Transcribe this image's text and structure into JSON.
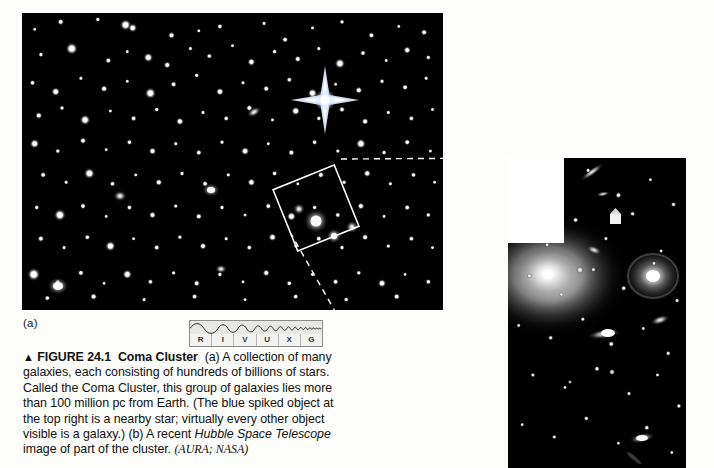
{
  "figure": {
    "panel_a_label": "(a)",
    "caption": {
      "triangle": "▲",
      "figure_number": "FIGURE 24.1",
      "figure_title": "Coma Cluster",
      "body_part_a": "(a) A collection of many galaxies, each consisting of hundreds of billions of stars. Called the Coma Cluster, this group of galaxies lies more than 100 million pc from Earth. (The blue spiked object at the top right is a nearby star; virtually every other object visible is a galaxy.)",
      "body_part_b_before": "(b) A recent ",
      "body_part_b_italic": "Hubble Space Telescope",
      "body_part_b_after": " image of part of the cluster. ",
      "credit": "(AURA; NASA)"
    }
  },
  "spectrum_band": {
    "name": "RIVUXG wavelength band indicator",
    "labels": [
      "R",
      "I",
      "V",
      "U",
      "X",
      "G"
    ],
    "active": "V",
    "box_color": "#e7e7e4",
    "border_color": "#8c8c8c"
  },
  "panel_a": {
    "name": "coma-cluster-wide-field",
    "background": "#000000",
    "callout_box": {
      "rotation_deg": -22,
      "center_x": 316,
      "center_y": 208,
      "size": 66,
      "stroke": "#ffffff"
    },
    "spiked_star": {
      "center_x": 325,
      "center_y": 100,
      "color": "#dfe8ff",
      "note": "blue spiked nearby star at top right"
    }
  },
  "panel_b": {
    "name": "hubble-close-up",
    "background": "#000000",
    "notch_color": "#ffffff"
  },
  "leader_lines": {
    "stroke": "#ffffff",
    "dash": "6 5"
  },
  "chart_data": {
    "type": "scatter",
    "xlabel": "",
    "ylabel": "",
    "note": "Point sources plotted as normalized coordinates 0-1 within panel a; r = relative brightness radius in px",
    "series": [
      {
        "name": "panel_a_sources",
        "points": [
          [
            0.03,
            0.055,
            1.0
          ],
          [
            0.092,
            0.03,
            1.5
          ],
          [
            0.18,
            0.022,
            1.2
          ],
          [
            0.246,
            0.04,
            2.6
          ],
          [
            0.263,
            0.05,
            2.0
          ],
          [
            0.355,
            0.075,
            1.6
          ],
          [
            0.42,
            0.06,
            1.0
          ],
          [
            0.47,
            0.045,
            1.3
          ],
          [
            0.575,
            0.035,
            1.1
          ],
          [
            0.625,
            0.09,
            1.4
          ],
          [
            0.69,
            0.05,
            1.0
          ],
          [
            0.76,
            0.03,
            1.2
          ],
          [
            0.83,
            0.075,
            1.4
          ],
          [
            0.895,
            0.045,
            1.0
          ],
          [
            0.955,
            0.065,
            1.5
          ],
          [
            0.045,
            0.14,
            1.2
          ],
          [
            0.118,
            0.12,
            2.8
          ],
          [
            0.205,
            0.16,
            1.4
          ],
          [
            0.25,
            0.13,
            1.0
          ],
          [
            0.3,
            0.15,
            2.2
          ],
          [
            0.345,
            0.175,
            1.6
          ],
          [
            0.4,
            0.12,
            1.1
          ],
          [
            0.445,
            0.145,
            1.3
          ],
          [
            0.5,
            0.11,
            1.0
          ],
          [
            0.545,
            0.165,
            1.8
          ],
          [
            0.6,
            0.13,
            1.2
          ],
          [
            0.655,
            0.155,
            1.5
          ],
          [
            0.705,
            0.12,
            1.1
          ],
          [
            0.755,
            0.17,
            2.4
          ],
          [
            0.81,
            0.135,
            1.3
          ],
          [
            0.865,
            0.16,
            1.0
          ],
          [
            0.915,
            0.125,
            1.7
          ],
          [
            0.965,
            0.15,
            1.2
          ],
          [
            0.025,
            0.235,
            1.3
          ],
          [
            0.08,
            0.265,
            2.0
          ],
          [
            0.14,
            0.22,
            1.1
          ],
          [
            0.195,
            0.255,
            1.6
          ],
          [
            0.25,
            0.23,
            1.0
          ],
          [
            0.305,
            0.27,
            2.6
          ],
          [
            0.36,
            0.24,
            1.4
          ],
          [
            0.415,
            0.21,
            1.2
          ],
          [
            0.47,
            0.265,
            1.8
          ],
          [
            0.525,
            0.235,
            1.1
          ],
          [
            0.58,
            0.255,
            1.5
          ],
          [
            0.635,
            0.225,
            1.3
          ],
          [
            0.69,
            0.27,
            2.2
          ],
          [
            0.745,
            0.24,
            1.0
          ],
          [
            0.8,
            0.26,
            1.6
          ],
          [
            0.855,
            0.23,
            1.2
          ],
          [
            0.91,
            0.25,
            1.4
          ],
          [
            0.96,
            0.22,
            1.1
          ],
          [
            0.04,
            0.345,
            1.6
          ],
          [
            0.095,
            0.32,
            1.2
          ],
          [
            0.15,
            0.36,
            2.4
          ],
          [
            0.21,
            0.33,
            1.0
          ],
          [
            0.265,
            0.355,
            1.4
          ],
          [
            0.32,
            0.325,
            1.2
          ],
          [
            0.375,
            0.365,
            1.8
          ],
          [
            0.43,
            0.335,
            1.1
          ],
          [
            0.485,
            0.355,
            1.3
          ],
          [
            0.54,
            0.32,
            1.5
          ],
          [
            0.595,
            0.36,
            1.0
          ],
          [
            0.65,
            0.33,
            2.0
          ],
          [
            0.705,
            0.355,
            1.2
          ],
          [
            0.76,
            0.325,
            1.4
          ],
          [
            0.815,
            0.365,
            1.6
          ],
          [
            0.87,
            0.335,
            1.1
          ],
          [
            0.925,
            0.355,
            1.3
          ],
          [
            0.975,
            0.325,
            1.0
          ],
          [
            0.03,
            0.44,
            2.2
          ],
          [
            0.085,
            0.465,
            1.2
          ],
          [
            0.145,
            0.43,
            1.5
          ],
          [
            0.2,
            0.46,
            1.0
          ],
          [
            0.255,
            0.435,
            1.3
          ],
          [
            0.31,
            0.465,
            1.7
          ],
          [
            0.365,
            0.44,
            1.1
          ],
          [
            0.42,
            0.47,
            1.4
          ],
          [
            0.475,
            0.435,
            1.2
          ],
          [
            0.53,
            0.465,
            1.9
          ],
          [
            0.585,
            0.44,
            1.0
          ],
          [
            0.64,
            0.47,
            1.5
          ],
          [
            0.695,
            0.435,
            1.3
          ],
          [
            0.75,
            0.465,
            1.1
          ],
          [
            0.805,
            0.44,
            2.3
          ],
          [
            0.86,
            0.47,
            1.2
          ],
          [
            0.915,
            0.435,
            1.4
          ],
          [
            0.97,
            0.465,
            1.0
          ],
          [
            0.05,
            0.545,
            1.4
          ],
          [
            0.105,
            0.57,
            1.1
          ],
          [
            0.16,
            0.54,
            2.5
          ],
          [
            0.215,
            0.575,
            1.3
          ],
          [
            0.27,
            0.545,
            1.0
          ],
          [
            0.325,
            0.57,
            1.6
          ],
          [
            0.38,
            0.54,
            1.2
          ],
          [
            0.435,
            0.575,
            1.4
          ],
          [
            0.49,
            0.545,
            1.1
          ],
          [
            0.545,
            0.57,
            1.8
          ],
          [
            0.6,
            0.54,
            1.3
          ],
          [
            0.655,
            0.575,
            1.0
          ],
          [
            0.71,
            0.545,
            1.5
          ],
          [
            0.765,
            0.57,
            1.2
          ],
          [
            0.82,
            0.54,
            1.7
          ],
          [
            0.875,
            0.575,
            1.1
          ],
          [
            0.93,
            0.545,
            1.3
          ],
          [
            0.98,
            0.57,
            1.0
          ],
          [
            0.035,
            0.655,
            1.2
          ],
          [
            0.09,
            0.68,
            2.7
          ],
          [
            0.145,
            0.65,
            1.4
          ],
          [
            0.2,
            0.685,
            1.0
          ],
          [
            0.255,
            0.655,
            1.3
          ],
          [
            0.31,
            0.68,
            1.6
          ],
          [
            0.365,
            0.65,
            1.1
          ],
          [
            0.42,
            0.685,
            1.5
          ],
          [
            0.475,
            0.655,
            1.2
          ],
          [
            0.53,
            0.68,
            1.0
          ],
          [
            0.585,
            0.65,
            1.4
          ],
          [
            0.64,
            0.685,
            2.1
          ],
          [
            0.695,
            0.655,
            1.2
          ],
          [
            0.75,
            0.68,
            1.3
          ],
          [
            0.805,
            0.65,
            1.6
          ],
          [
            0.86,
            0.685,
            1.0
          ],
          [
            0.915,
            0.655,
            1.4
          ],
          [
            0.965,
            0.68,
            1.2
          ],
          [
            0.045,
            0.76,
            1.5
          ],
          [
            0.1,
            0.79,
            1.1
          ],
          [
            0.155,
            0.755,
            1.3
          ],
          [
            0.21,
            0.785,
            2.4
          ],
          [
            0.265,
            0.76,
            1.0
          ],
          [
            0.32,
            0.79,
            1.4
          ],
          [
            0.375,
            0.755,
            1.2
          ],
          [
            0.43,
            0.785,
            1.6
          ],
          [
            0.485,
            0.76,
            1.1
          ],
          [
            0.54,
            0.79,
            1.3
          ],
          [
            0.595,
            0.755,
            1.8
          ],
          [
            0.65,
            0.785,
            1.0
          ],
          [
            0.705,
            0.76,
            1.4
          ],
          [
            0.76,
            0.79,
            1.2
          ],
          [
            0.815,
            0.755,
            1.5
          ],
          [
            0.87,
            0.785,
            1.1
          ],
          [
            0.925,
            0.76,
            1.3
          ],
          [
            0.975,
            0.79,
            1.0
          ],
          [
            0.028,
            0.88,
            3.0
          ],
          [
            0.085,
            0.905,
            1.2
          ],
          [
            0.14,
            0.875,
            1.4
          ],
          [
            0.195,
            0.91,
            1.0
          ],
          [
            0.25,
            0.88,
            2.2
          ],
          [
            0.305,
            0.905,
            1.3
          ],
          [
            0.36,
            0.875,
            1.1
          ],
          [
            0.415,
            0.91,
            1.5
          ],
          [
            0.47,
            0.88,
            1.2
          ],
          [
            0.525,
            0.905,
            1.0
          ],
          [
            0.58,
            0.875,
            1.6
          ],
          [
            0.635,
            0.91,
            1.3
          ],
          [
            0.69,
            0.88,
            1.1
          ],
          [
            0.745,
            0.905,
            1.4
          ],
          [
            0.8,
            0.875,
            1.2
          ],
          [
            0.855,
            0.91,
            1.9
          ],
          [
            0.91,
            0.88,
            1.0
          ],
          [
            0.965,
            0.905,
            1.3
          ],
          [
            0.06,
            0.96,
            1.3
          ],
          [
            0.17,
            0.955,
            1.6
          ],
          [
            0.29,
            0.965,
            1.1
          ],
          [
            0.41,
            0.955,
            1.4
          ],
          [
            0.53,
            0.965,
            1.0
          ],
          [
            0.65,
            0.955,
            1.3
          ],
          [
            0.77,
            0.965,
            1.2
          ],
          [
            0.89,
            0.955,
            1.5
          ]
        ]
      },
      {
        "name": "panel_b_sources",
        "points": [
          [
            0.1,
            0.06,
            1.0
          ],
          [
            0.28,
            0.1,
            1.3
          ],
          [
            0.45,
            0.04,
            1.1
          ],
          [
            0.62,
            0.12,
            1.4
          ],
          [
            0.8,
            0.07,
            1.0
          ],
          [
            0.93,
            0.15,
            1.2
          ],
          [
            0.07,
            0.22,
            1.1
          ],
          [
            0.22,
            0.28,
            1.0
          ],
          [
            0.38,
            0.2,
            1.3
          ],
          [
            0.55,
            0.26,
            1.1
          ],
          [
            0.7,
            0.18,
            1.2
          ],
          [
            0.86,
            0.3,
            1.0
          ],
          [
            0.12,
            0.38,
            1.2
          ],
          [
            0.3,
            0.44,
            1.0
          ],
          [
            0.48,
            0.36,
            1.1
          ],
          [
            0.65,
            0.42,
            1.3
          ],
          [
            0.82,
            0.34,
            1.0
          ],
          [
            0.95,
            0.46,
            1.1
          ],
          [
            0.06,
            0.54,
            1.0
          ],
          [
            0.24,
            0.58,
            1.2
          ],
          [
            0.42,
            0.52,
            1.1
          ],
          [
            0.58,
            0.6,
            1.4
          ],
          [
            0.76,
            0.55,
            1.0
          ],
          [
            0.9,
            0.63,
            1.2
          ],
          [
            0.14,
            0.7,
            1.1
          ],
          [
            0.32,
            0.74,
            1.0
          ],
          [
            0.5,
            0.68,
            1.3
          ],
          [
            0.68,
            0.76,
            1.1
          ],
          [
            0.84,
            0.7,
            1.0
          ],
          [
            0.96,
            0.8,
            1.2
          ],
          [
            0.08,
            0.86,
            1.0
          ],
          [
            0.26,
            0.9,
            1.1
          ],
          [
            0.44,
            0.84,
            1.2
          ],
          [
            0.62,
            0.92,
            1.0
          ],
          [
            0.78,
            0.87,
            1.3
          ],
          [
            0.92,
            0.95,
            1.0
          ]
        ]
      }
    ]
  }
}
